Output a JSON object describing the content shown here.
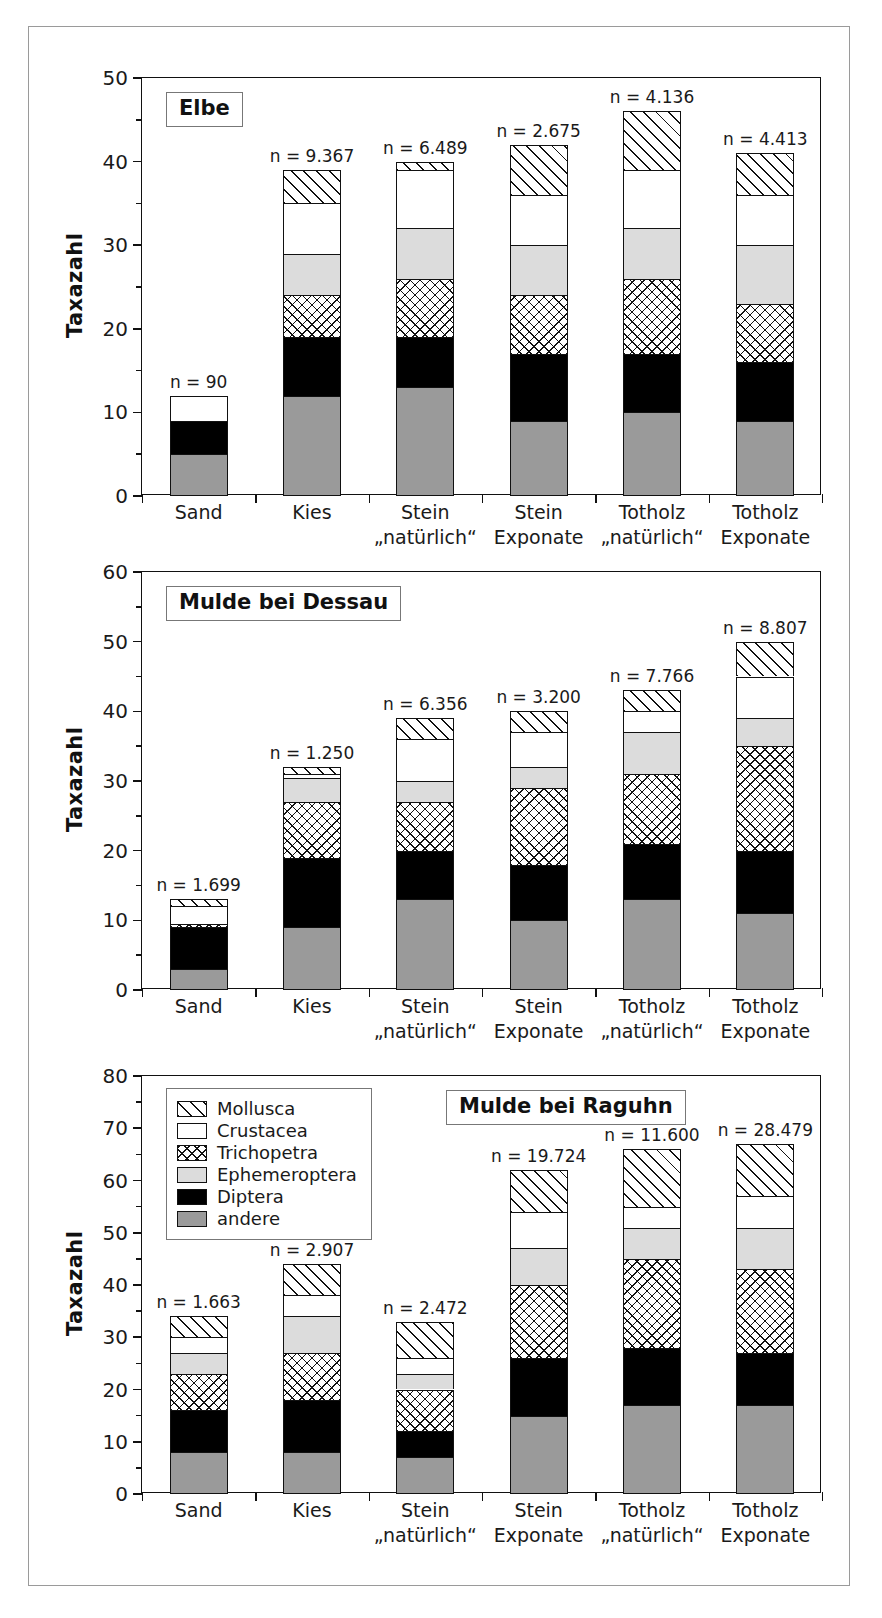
{
  "figure": {
    "ylabel": "Taxazahl",
    "categories": [
      "Sand",
      "Kies",
      "Stein\n„natürlich“",
      "Stein\nExponate",
      "Totholz\n„natürlich“",
      "Totholz\nExponate"
    ],
    "legend": {
      "items": [
        {
          "label": "Mollusca",
          "key": "mollusca"
        },
        {
          "label": "Crustacea",
          "key": "crustacea"
        },
        {
          "label": "Trichopetra",
          "key": "trichopetra"
        },
        {
          "label": "Ephemeroptera",
          "key": "ephemeroptera"
        },
        {
          "label": "Diptera",
          "key": "diptera"
        },
        {
          "label": "andere",
          "key": "andere"
        }
      ]
    },
    "colors": {
      "andere": "#9a9a9a",
      "diptera": "#000000",
      "ephemeroptera": "#dcdcdc",
      "crustacea": "#ffffff",
      "trichopetra": "#ffffff",
      "mollusca": "#ffffff",
      "outline": "#111111",
      "frame": "#9a9a9a"
    }
  },
  "chart_data": [
    {
      "type": "bar",
      "title": "Elbe",
      "xlabel": "",
      "ylabel": "Taxazahl",
      "ylim": [
        0,
        50
      ],
      "yticks": [
        0,
        10,
        20,
        30,
        40,
        50
      ],
      "yminor": [
        5,
        15,
        25,
        35,
        45
      ],
      "grid": false,
      "legend_position": "none",
      "stacked": true,
      "categories": [
        "Sand",
        "Kies",
        "Stein „natürlich“",
        "Stein Exponate",
        "Totholz „natürlich“",
        "Totholz Exponate"
      ],
      "series": [
        {
          "name": "andere",
          "values": [
            5,
            12,
            13,
            9,
            10,
            9
          ]
        },
        {
          "name": "Diptera",
          "values": [
            4,
            7,
            6,
            8,
            7,
            7
          ]
        },
        {
          "name": "Trichopetra",
          "values": [
            0,
            5,
            7,
            7,
            9,
            7
          ]
        },
        {
          "name": "Ephemeroptera",
          "values": [
            0,
            5,
            6,
            6,
            6,
            7
          ]
        },
        {
          "name": "Crustacea",
          "values": [
            3,
            6,
            7,
            6,
            7,
            6
          ]
        },
        {
          "name": "Mollusca",
          "values": [
            0,
            4,
            1,
            6,
            7,
            5
          ]
        }
      ],
      "totals": [
        12,
        39,
        40,
        42,
        46,
        41
      ],
      "annotations": [
        "n = 90",
        "n = 9.367",
        "n = 6.489",
        "n = 2.675",
        "n = 4.136",
        "n = 4.413"
      ]
    },
    {
      "type": "bar",
      "title": "Mulde bei Dessau",
      "xlabel": "",
      "ylabel": "Taxazahl",
      "ylim": [
        0,
        60
      ],
      "yticks": [
        0,
        10,
        20,
        30,
        40,
        50,
        60
      ],
      "yminor": [
        5,
        15,
        25,
        35,
        45,
        55
      ],
      "grid": false,
      "legend_position": "none",
      "stacked": true,
      "categories": [
        "Sand",
        "Kies",
        "Stein „natürlich“",
        "Stein Exponate",
        "Totholz „natürlich“",
        "Totholz Exponate"
      ],
      "series": [
        {
          "name": "andere",
          "values": [
            3,
            9,
            13,
            10,
            13,
            11
          ]
        },
        {
          "name": "Diptera",
          "values": [
            6,
            10,
            7,
            8,
            8,
            9
          ]
        },
        {
          "name": "Trichopetra",
          "values": [
            0.5,
            8,
            7,
            11,
            10,
            15
          ]
        },
        {
          "name": "Ephemeroptera",
          "values": [
            0,
            3.5,
            3,
            3,
            6,
            4
          ]
        },
        {
          "name": "Crustacea",
          "values": [
            2.5,
            0.5,
            6,
            5,
            3,
            6
          ]
        },
        {
          "name": "Mollusca",
          "values": [
            1,
            1,
            3,
            3,
            3,
            5
          ]
        }
      ],
      "totals": [
        13,
        32,
        39,
        40,
        43,
        50
      ],
      "annotations": [
        "n = 1.699",
        "n = 1.250",
        "n = 6.356",
        "n = 3.200",
        "n = 7.766",
        "n = 8.807"
      ]
    },
    {
      "type": "bar",
      "title": "Mulde bei Raguhn",
      "xlabel": "",
      "ylabel": "Taxazahl",
      "ylim": [
        0,
        80
      ],
      "yticks": [
        0,
        10,
        20,
        30,
        40,
        50,
        60,
        70,
        80
      ],
      "yminor": [
        5,
        15,
        25,
        35,
        45,
        55,
        65,
        75
      ],
      "grid": false,
      "legend_position": "upper-left",
      "stacked": true,
      "categories": [
        "Sand",
        "Kies",
        "Stein „natürlich“",
        "Stein Exponate",
        "Totholz „natürlich“",
        "Totholz Exponate"
      ],
      "series": [
        {
          "name": "andere",
          "values": [
            8,
            8,
            7,
            15,
            17,
            17
          ]
        },
        {
          "name": "Diptera",
          "values": [
            8,
            10,
            5,
            11,
            11,
            10
          ]
        },
        {
          "name": "Trichopetra",
          "values": [
            7,
            9,
            8,
            14,
            17,
            16
          ]
        },
        {
          "name": "Ephemeroptera",
          "values": [
            4,
            7,
            3,
            7,
            6,
            8
          ]
        },
        {
          "name": "Crustacea",
          "values": [
            3,
            4,
            3,
            7,
            4,
            6
          ]
        },
        {
          "name": "Mollusca",
          "values": [
            4,
            6,
            7,
            8,
            11,
            10
          ]
        }
      ],
      "totals": [
        34,
        44,
        33,
        62,
        66,
        67
      ],
      "annotations": [
        "n = 1.663",
        "n = 2.907",
        "n = 2.472",
        "n = 19.724",
        "n = 11.600",
        "n = 28.479"
      ]
    }
  ]
}
